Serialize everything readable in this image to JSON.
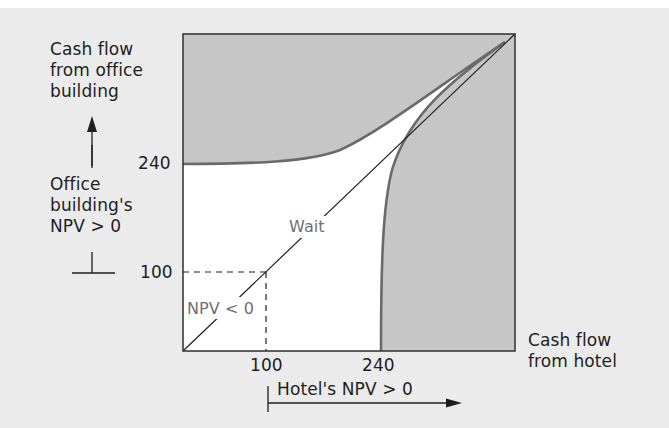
{
  "diagram": {
    "title": "",
    "y_axis_label": [
      "Cash flow",
      "from office",
      "building"
    ],
    "x_axis_label": [
      "Cash flow",
      "from hotel"
    ],
    "y_ticks": [
      {
        "label": "240",
        "value": 240
      },
      {
        "label": "100",
        "value": 100
      }
    ],
    "x_ticks": [
      {
        "label": "100",
        "value": 100
      },
      {
        "label": "240",
        "value": 240
      }
    ],
    "y_region_label": [
      "Office",
      "building's",
      "NPV > 0"
    ],
    "x_region_label": "Hotel's NPV > 0",
    "regions": {
      "wait": "Wait",
      "npv_negative": "NPV < 0"
    },
    "colors": {
      "page_background": "#ebebeb",
      "shaded_region": "#c6c6c6",
      "unshaded_region": "#ffffff",
      "boundary_curve": "#6a6a6a",
      "frame": "#3a3a3a",
      "text": "#1e1e1e",
      "inner_text": "#707070"
    }
  }
}
